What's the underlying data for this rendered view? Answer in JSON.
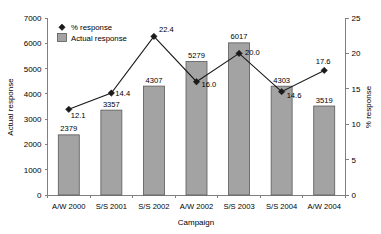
{
  "chart_data": {
    "type": "bar",
    "title": "",
    "xlabel": "Campaign",
    "ylabel": "Actual response",
    "y2label": "% response",
    "categories": [
      "A/W 2000",
      "S/S 2001",
      "S/S 2002",
      "A/W 2002",
      "S/S 2003",
      "S/S 2004",
      "A/W 2004"
    ],
    "ylim": [
      0,
      7000
    ],
    "y2lim": [
      0,
      25
    ],
    "yticks": [
      0,
      1000,
      2000,
      3000,
      4000,
      5000,
      6000,
      7000
    ],
    "y2ticks": [
      0,
      5,
      10,
      15,
      20,
      25
    ],
    "grid": false,
    "legend_position": "top-left",
    "series": [
      {
        "name": "Actual response",
        "type": "bar",
        "axis": "left",
        "values": [
          2379,
          3357,
          4307,
          5279,
          6017,
          4303,
          3519
        ],
        "labels": [
          "2379",
          "3357",
          "4307",
          "5279",
          "6017",
          "4303",
          "3519"
        ],
        "color": "#a3a3a3"
      },
      {
        "name": "% response",
        "type": "line",
        "axis": "right",
        "values": [
          12.1,
          14.4,
          22.4,
          16.0,
          20.0,
          14.6,
          17.6
        ],
        "labels": [
          "12.1",
          "14.4",
          "22.4",
          "16.0",
          "20.0",
          "14.6",
          "17.6"
        ],
        "color": "#1a1a1a"
      }
    ]
  },
  "axes": {
    "left": {
      "title": "Actual response",
      "tick_labels": [
        "0",
        "1000",
        "2000",
        "3000",
        "4000",
        "5000",
        "6000",
        "7000"
      ]
    },
    "right": {
      "title": "% response",
      "tick_labels": [
        "0",
        "5",
        "10",
        "15",
        "20",
        "25"
      ]
    },
    "bottom": {
      "title": "Campaign",
      "tick_labels": [
        "A/W 2000",
        "S/S 2001",
        "S/S 2002",
        "A/W 2002",
        "S/S 2003",
        "S/S 2004",
        "A/W 2004"
      ]
    }
  },
  "legend": {
    "items": [
      {
        "label": "% response",
        "marker": "diamond-marker-icon"
      },
      {
        "label": "Actual response",
        "marker": "square-swatch-icon"
      }
    ]
  },
  "bar_labels": [
    "2379",
    "3357",
    "4307",
    "5279",
    "6017",
    "4303",
    "3519"
  ],
  "point_labels": [
    "12.1",
    "14.4",
    "22.4",
    "16.0",
    "20.0",
    "14.6",
    "17.6"
  ]
}
